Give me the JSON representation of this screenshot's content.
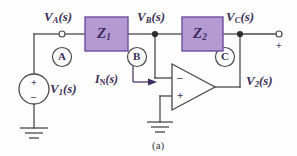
{
  "figure": {
    "caption": "(a)",
    "type": "circuit-schematic"
  },
  "colors": {
    "wire": "#4a4a4a",
    "impedance_fill": "#b49ad0",
    "impedance_border": "#6b4f9e",
    "label_text": "#3a2f55",
    "background": "#fdfdfd"
  },
  "labels": {
    "v_a": {
      "main": "V",
      "sub": "A",
      "arg": "(s)"
    },
    "v_b": {
      "main": "V",
      "sub": "B",
      "arg": "(s)"
    },
    "v_c": {
      "main": "V",
      "sub": "C",
      "arg": "(s)"
    },
    "v_1": {
      "main": "V",
      "sub": "1",
      "arg": "(s)"
    },
    "v_2": {
      "main": "V",
      "sub": "2",
      "arg": "(s)"
    },
    "i_n": {
      "main": "I",
      "sub": "N",
      "arg": "(s)"
    }
  },
  "impedances": [
    {
      "name": "Z1",
      "main": "Z",
      "sub": "1"
    },
    {
      "name": "Z2",
      "main": "Z",
      "sub": "2"
    }
  ],
  "nodes": [
    {
      "id": "A",
      "letter": "A"
    },
    {
      "id": "B",
      "letter": "B"
    },
    {
      "id": "C",
      "letter": "C"
    }
  ],
  "source": {
    "name": "V1",
    "plus": "+",
    "minus": "–"
  },
  "opamp": {
    "inverting_sign": "–",
    "noninverting_sign": "+"
  },
  "output_terminal": {
    "polarity": "+"
  }
}
